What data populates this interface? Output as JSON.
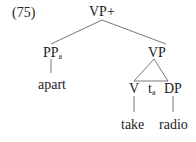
{
  "example_number": "(75)",
  "tree": {
    "root": "VP+",
    "left_child": {
      "label": "PP",
      "subscript": "a",
      "leaf": "apart"
    },
    "right_child": {
      "label": "VP",
      "children": [
        {
          "label": "V",
          "leaf": "take"
        },
        {
          "label": "t",
          "subscript": "a"
        },
        {
          "label": "DP",
          "leaf": "radio"
        }
      ]
    }
  },
  "colors": {
    "text": "#222222",
    "lines": "#555555",
    "background": "#ffffff"
  }
}
